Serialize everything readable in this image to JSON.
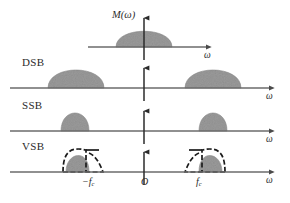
{
  "figure": {
    "width": 290,
    "height": 203,
    "background": "#ffffff",
    "spectrum_fill": "#9a9a9a",
    "axis_color": "#6b6b6b",
    "outline_color": "#1a1a1a",
    "text_color": "#2b2b2b"
  },
  "labels": {
    "baseband_function": "M(ω)",
    "origin": "O",
    "neg_carrier_prefix": "−f",
    "neg_carrier_sub": "c",
    "pos_carrier_prefix": "f",
    "pos_carrier_sub": "c",
    "omega": "ω"
  },
  "rows": [
    {
      "name": "baseband",
      "label": "",
      "axis_y": 47,
      "axis_x_start": 88,
      "axis_x_end": 212,
      "omega_label": "ω",
      "omega_x": 205,
      "omega_y": 51,
      "shapes": [
        {
          "kind": "dome",
          "center_x": 144,
          "half_width": 28,
          "height": 26
        }
      ]
    },
    {
      "name": "DSB",
      "label": "DSB",
      "label_x": 22,
      "label_y": 56,
      "axis_y": 88,
      "axis_x_start": 10,
      "axis_x_end": 275,
      "omega_label": "ω",
      "omega_x": 268,
      "omega_y": 92,
      "shapes": [
        {
          "kind": "dome",
          "center_x": 76,
          "half_width": 28,
          "height": 24
        },
        {
          "kind": "dome",
          "center_x": 213,
          "half_width": 28,
          "height": 24
        }
      ]
    },
    {
      "name": "SSB",
      "label": "SSB",
      "label_x": 22,
      "label_y": 99,
      "axis_y": 131,
      "axis_x_start": 10,
      "axis_x_end": 275,
      "omega_label": "ω",
      "omega_x": 268,
      "omega_y": 135,
      "shapes": [
        {
          "kind": "half-dome-left",
          "edge_x": 89,
          "half_width": 28,
          "height": 24
        },
        {
          "kind": "half-dome-right",
          "edge_x": 199,
          "half_width": 28,
          "height": 24
        }
      ]
    },
    {
      "name": "VSB",
      "label": "VSB",
      "label_x": 22,
      "label_y": 140,
      "axis_y": 172,
      "axis_x_start": 10,
      "axis_x_end": 275,
      "omega_label": "ω",
      "omega_x": 268,
      "omega_y": 176,
      "shapes": [
        {
          "kind": "vsb-left",
          "carrier_x": 89,
          "half_width": 28,
          "height": 22
        },
        {
          "kind": "vsb-right",
          "carrier_x": 199,
          "half_width": 28,
          "height": 22
        }
      ]
    }
  ],
  "ticks": [
    {
      "name": "neg-carrier",
      "x": 89,
      "y": 186,
      "text": "−f",
      "sub": "c"
    },
    {
      "name": "origin",
      "x": 144,
      "y": 186,
      "text": "O",
      "sub": ""
    },
    {
      "name": "pos-carrier",
      "x": 199,
      "y": 186,
      "text": "f",
      "sub": "c"
    }
  ],
  "vertical_axis": {
    "name": "vertical-axis",
    "x": 144,
    "segments": [
      {
        "top": 12,
        "bottom": 60
      },
      {
        "top": 62,
        "bottom": 101
      },
      {
        "top": 105,
        "bottom": 144
      },
      {
        "top": 148,
        "bottom": 185
      }
    ]
  },
  "function_label": {
    "x": 112,
    "y": 10,
    "text": "M(ω)"
  }
}
